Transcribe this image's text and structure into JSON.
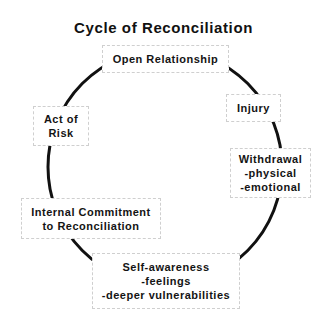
{
  "diagram": {
    "title": "Cycle of Reconciliation",
    "type": "cycle",
    "nodes": [
      {
        "id": "open-relationship",
        "lines": [
          "Open Relationship"
        ]
      },
      {
        "id": "injury",
        "lines": [
          "Injury"
        ]
      },
      {
        "id": "withdrawal",
        "lines": [
          "Withdrawal",
          "-physical",
          "-emotional"
        ]
      },
      {
        "id": "self-awareness",
        "lines": [
          "Self-awareness",
          "-feelings",
          "-deeper vulnerabilities"
        ]
      },
      {
        "id": "internal-commitment",
        "lines": [
          "Internal Commitment",
          "to Reconciliation"
        ]
      },
      {
        "id": "act-of-risk",
        "lines": [
          "Act of",
          "Risk"
        ]
      }
    ],
    "colors": {
      "line": "#111111",
      "box_border": "#cfcfcf",
      "background": "#ffffff"
    }
  }
}
